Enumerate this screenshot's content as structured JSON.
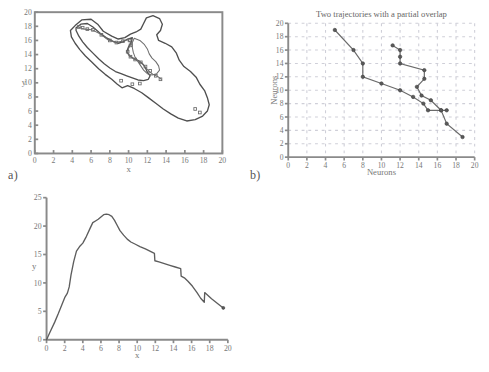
{
  "figure": {
    "background": "#ffffff",
    "ink": "#4f4f4f",
    "grid_color": "#cfcfd8"
  },
  "panels": [
    {
      "id": "a",
      "label": "a)",
      "title": "",
      "xlabel": "x",
      "ylabel": "y",
      "xticks": [
        0,
        2,
        4,
        6,
        8,
        10,
        12,
        14,
        16,
        18,
        20
      ],
      "yticks": [
        0,
        2,
        4,
        6,
        8,
        10,
        12,
        14,
        16,
        18,
        20
      ],
      "xlim": [
        0,
        20
      ],
      "ylim": [
        0,
        20
      ],
      "grid": false,
      "framed": true
    },
    {
      "id": "b",
      "label": "b)",
      "title": "Two trajectories with a partial overlap",
      "xlabel": "Neurons",
      "ylabel": "Neurons",
      "xticks": [
        0,
        2,
        4,
        6,
        8,
        10,
        12,
        14,
        16,
        18,
        20
      ],
      "yticks": [
        0,
        2,
        4,
        6,
        8,
        10,
        12,
        14,
        16,
        18,
        20
      ],
      "xlim": [
        0,
        20
      ],
      "ylim": [
        0,
        20
      ],
      "grid": true,
      "framed": false
    },
    {
      "id": "c",
      "label": "c)",
      "title": "",
      "xlabel": "x",
      "ylabel": "y",
      "xticks": [
        0,
        2,
        4,
        6,
        8,
        10,
        12,
        14,
        16,
        18,
        20
      ],
      "yticks": [
        0,
        5,
        10,
        15,
        20,
        25
      ],
      "xlim": [
        0,
        20
      ],
      "ylim": [
        0,
        25
      ],
      "grid": false,
      "framed": false
    }
  ],
  "chart_data": [
    {
      "type": "line",
      "panel": "a",
      "title": "",
      "xlabel": "x",
      "ylabel": "y",
      "xlim": [
        0,
        20
      ],
      "ylim": [
        0,
        20
      ],
      "grid": false,
      "legend": "none",
      "description": "Closed contour outlines of two overlapping elongated regions running from upper-left to lower-right, with small square markers scattered along inner ridge lines.",
      "series": [
        {
          "name": "outer-contour",
          "closed": true,
          "points": [
            [
              4.3,
              18.1
            ],
            [
              5.0,
              18.9
            ],
            [
              6.0,
              19.0
            ],
            [
              6.7,
              18.3
            ],
            [
              7.3,
              17.3
            ],
            [
              8.2,
              16.6
            ],
            [
              8.9,
              16.2
            ],
            [
              9.6,
              16.4
            ],
            [
              10.2,
              16.9
            ],
            [
              10.8,
              17.2
            ],
            [
              11.3,
              17.6
            ],
            [
              11.6,
              18.4
            ],
            [
              11.9,
              19.2
            ],
            [
              12.6,
              19.5
            ],
            [
              13.3,
              19.1
            ],
            [
              13.6,
              18.3
            ],
            [
              13.4,
              17.4
            ],
            [
              13.0,
              16.8
            ],
            [
              13.2,
              16.0
            ],
            [
              13.9,
              15.6
            ],
            [
              14.6,
              15.1
            ],
            [
              15.1,
              14.2
            ],
            [
              15.4,
              13.2
            ],
            [
              15.9,
              12.3
            ],
            [
              16.6,
              11.6
            ],
            [
              17.2,
              10.8
            ],
            [
              17.6,
              9.8
            ],
            [
              18.1,
              8.9
            ],
            [
              18.4,
              7.9
            ],
            [
              18.6,
              6.9
            ],
            [
              18.4,
              6.0
            ],
            [
              17.9,
              5.3
            ],
            [
              17.1,
              4.8
            ],
            [
              16.2,
              4.6
            ],
            [
              15.3,
              5.0
            ],
            [
              14.5,
              5.6
            ],
            [
              13.7,
              6.3
            ],
            [
              12.9,
              7.1
            ],
            [
              12.1,
              7.9
            ],
            [
              11.4,
              8.6
            ],
            [
              10.6,
              9.2
            ],
            [
              9.9,
              9.6
            ],
            [
              9.3,
              9.3
            ],
            [
              8.8,
              9.8
            ],
            [
              8.2,
              10.5
            ],
            [
              7.5,
              11.2
            ],
            [
              6.8,
              12.0
            ],
            [
              6.1,
              12.9
            ],
            [
              5.4,
              13.8
            ],
            [
              4.8,
              14.7
            ],
            [
              4.3,
              15.6
            ],
            [
              3.9,
              16.5
            ],
            [
              3.8,
              17.4
            ],
            [
              4.3,
              18.1
            ]
          ]
        },
        {
          "name": "inner-contour-1",
          "closed": true,
          "points": [
            [
              4.4,
              17.8
            ],
            [
              4.9,
              18.3
            ],
            [
              5.6,
              18.4
            ],
            [
              6.2,
              17.9
            ],
            [
              6.9,
              17.1
            ],
            [
              7.6,
              16.4
            ],
            [
              8.3,
              15.9
            ],
            [
              8.9,
              15.6
            ],
            [
              9.4,
              15.8
            ],
            [
              9.9,
              16.2
            ],
            [
              10.4,
              16.4
            ],
            [
              10.3,
              15.8
            ],
            [
              10.0,
              15.1
            ],
            [
              9.8,
              14.4
            ],
            [
              10.1,
              13.8
            ],
            [
              10.6,
              13.4
            ],
            [
              11.1,
              13.1
            ],
            [
              11.5,
              12.7
            ],
            [
              11.8,
              12.1
            ],
            [
              12.0,
              11.5
            ],
            [
              12.3,
              11.0
            ],
            [
              12.1,
              10.5
            ],
            [
              11.6,
              10.3
            ],
            [
              11.0,
              10.4
            ],
            [
              10.4,
              10.7
            ],
            [
              9.8,
              11.0
            ],
            [
              9.2,
              11.3
            ],
            [
              8.6,
              11.6
            ],
            [
              8.0,
              12.1
            ],
            [
              7.4,
              12.7
            ],
            [
              6.8,
              13.4
            ],
            [
              6.2,
              14.2
            ],
            [
              5.6,
              15.0
            ],
            [
              5.1,
              15.8
            ],
            [
              4.7,
              16.6
            ],
            [
              4.4,
              17.4
            ],
            [
              4.4,
              17.8
            ]
          ]
        },
        {
          "name": "inner-contour-2",
          "closed": true,
          "points": [
            [
              10.6,
              16.3
            ],
            [
              11.2,
              16.0
            ],
            [
              11.7,
              15.4
            ],
            [
              12.0,
              14.8
            ],
            [
              12.2,
              14.1
            ],
            [
              12.5,
              13.5
            ],
            [
              12.9,
              13.0
            ],
            [
              13.2,
              12.4
            ],
            [
              13.3,
              11.8
            ],
            [
              13.0,
              11.3
            ],
            [
              12.5,
              11.1
            ],
            [
              12.0,
              11.3
            ],
            [
              11.6,
              11.8
            ],
            [
              11.3,
              12.4
            ],
            [
              11.0,
              13.0
            ],
            [
              10.7,
              13.6
            ],
            [
              10.5,
              14.3
            ],
            [
              10.4,
              15.0
            ],
            [
              10.4,
              15.7
            ],
            [
              10.6,
              16.3
            ]
          ]
        },
        {
          "name": "marker-ridge",
          "closed": false,
          "points": [
            [
              4.6,
              17.9
            ],
            [
              5.3,
              17.6
            ],
            [
              6.1,
              17.5
            ],
            [
              7.0,
              16.9
            ],
            [
              7.8,
              16.1
            ],
            [
              8.6,
              15.7
            ],
            [
              9.3,
              15.9
            ],
            [
              9.9,
              16.1
            ],
            [
              10.3,
              15.6
            ],
            [
              10.0,
              14.9
            ],
            [
              9.9,
              14.2
            ],
            [
              10.3,
              13.6
            ],
            [
              10.9,
              13.2
            ],
            [
              11.4,
              12.8
            ],
            [
              11.8,
              12.2
            ],
            [
              12.2,
              11.6
            ],
            [
              12.6,
              11.2
            ],
            [
              13.1,
              10.9
            ],
            [
              13.5,
              10.5
            ]
          ]
        }
      ],
      "markers": [
        [
          4.7,
          17.9
        ],
        [
          5.1,
          17.8
        ],
        [
          5.6,
          17.6
        ],
        [
          6.2,
          17.5
        ],
        [
          7.1,
          16.8
        ],
        [
          8.0,
          16.0
        ],
        [
          8.7,
          15.7
        ],
        [
          9.4,
          15.9
        ],
        [
          10.1,
          16.0
        ],
        [
          10.2,
          15.3
        ],
        [
          9.9,
          14.4
        ],
        [
          10.2,
          13.7
        ],
        [
          10.7,
          13.3
        ],
        [
          11.3,
          12.9
        ],
        [
          11.8,
          12.3
        ],
        [
          12.3,
          11.7
        ],
        [
          12.9,
          11.0
        ],
        [
          13.4,
          10.5
        ],
        [
          9.2,
          10.3
        ],
        [
          10.4,
          9.8
        ],
        [
          11.2,
          9.9
        ],
        [
          17.1,
          6.3
        ],
        [
          17.6,
          5.8
        ]
      ]
    },
    {
      "type": "line",
      "panel": "b",
      "title": "Two trajectories with a partial overlap",
      "xlabel": "Neurons",
      "ylabel": "Neurons",
      "xlim": [
        0,
        20
      ],
      "ylim": [
        0,
        20
      ],
      "grid": true,
      "legend": "none",
      "series": [
        {
          "name": "trajectory-1",
          "marker": "circle",
          "x": [
            5,
            7,
            8,
            8,
            10,
            12,
            13.4,
            14.5,
            15,
            16.4,
            17,
            18.7
          ],
          "y": [
            19,
            16,
            14,
            12,
            11,
            10,
            9,
            8,
            7,
            7,
            5,
            3
          ]
        },
        {
          "name": "trajectory-2",
          "marker": "circle",
          "x": [
            11.2,
            12,
            12,
            12,
            14.6,
            14.6,
            13.8,
            14.3,
            15.3,
            16.4,
            17
          ],
          "y": [
            16.7,
            16,
            15,
            14,
            13,
            11.7,
            10.5,
            9.2,
            8.5,
            7,
            7
          ]
        }
      ]
    },
    {
      "type": "line",
      "panel": "c",
      "title": "",
      "xlabel": "x",
      "ylabel": "y",
      "xlim": [
        0,
        20
      ],
      "ylim": [
        0,
        25
      ],
      "grid": false,
      "legend": "none",
      "description": "Single curve rising steeply to a plateau peak near x=6-7 at y≈22, then declining with small step discontinuities near x=12 and x=15, a dip at x=17 and a final point near x=19.5.",
      "series": [
        {
          "name": "curve",
          "x": [
            0,
            0.4,
            0.9,
            1.3,
            1.7,
            2.0,
            2.3,
            2.5,
            2.7,
            3.0,
            3.3,
            3.7,
            4.0,
            4.4,
            4.8,
            5.1,
            5.4,
            5.7,
            6.0,
            6.3,
            6.6,
            6.9,
            7.2,
            7.5,
            7.8,
            8.1,
            8.5,
            8.9,
            9.3,
            9.8,
            10.3,
            10.9,
            11.4,
            11.9,
            11.95,
            12.4,
            13.0,
            13.6,
            14.2,
            14.8,
            14.85,
            15.2,
            15.6,
            16.1,
            16.6,
            17.0,
            17.4,
            17.45,
            18.2,
            19.0,
            19.5
          ],
          "y": [
            0,
            1.4,
            3.1,
            4.6,
            6.2,
            7.4,
            8.2,
            9.3,
            11.4,
            13.8,
            15.6,
            16.5,
            17.0,
            18.2,
            19.6,
            20.6,
            20.9,
            21.2,
            21.6,
            22.0,
            22.1,
            22.0,
            21.7,
            21.0,
            20.1,
            19.2,
            18.4,
            17.7,
            17.2,
            16.8,
            16.4,
            16.0,
            15.6,
            15.2,
            13.9,
            13.7,
            13.4,
            13.1,
            12.8,
            12.5,
            11.2,
            10.9,
            10.3,
            9.4,
            8.3,
            7.3,
            6.6,
            8.3,
            7.2,
            6.2,
            5.6
          ]
        }
      ]
    }
  ]
}
